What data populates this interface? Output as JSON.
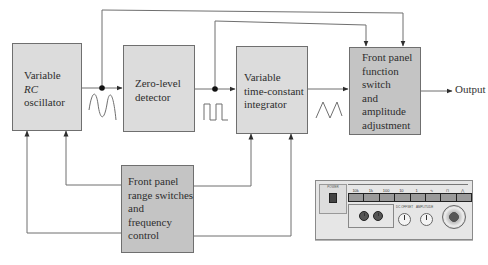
{
  "diagram": {
    "type": "block-diagram",
    "blocks": [
      {
        "id": "osc",
        "lines": [
          "Variable",
          "RC",
          "oscillator"
        ],
        "italic_line": 1
      },
      {
        "id": "zld",
        "lines": [
          "Zero-level",
          "detector"
        ]
      },
      {
        "id": "int",
        "lines": [
          "Variable",
          "time-constant",
          "integrator"
        ]
      },
      {
        "id": "fsw",
        "lines": [
          "Front panel",
          "function",
          "switch",
          "and",
          "amplitude",
          "adjustment"
        ]
      },
      {
        "id": "rng",
        "lines": [
          "Front panel",
          "range switches",
          "and",
          "frequency",
          "control"
        ]
      }
    ],
    "output_label": "Output",
    "waveforms": [
      {
        "between": "osc->zld",
        "shape": "sine"
      },
      {
        "between": "zld->int",
        "shape": "square"
      },
      {
        "between": "int->fsw",
        "shape": "triangle"
      }
    ],
    "connections": [
      {
        "from": "osc",
        "to": "zld"
      },
      {
        "from": "zld",
        "to": "int"
      },
      {
        "from": "int",
        "to": "fsw"
      },
      {
        "from": "fsw",
        "to": "output"
      },
      {
        "from": "osc-output-node",
        "to": "fsw",
        "route": "top"
      },
      {
        "from": "zld-output-node",
        "to": "fsw",
        "route": "top"
      },
      {
        "from": "rng",
        "to": "osc",
        "count": 2
      },
      {
        "from": "rng",
        "to": "int",
        "count": 2
      }
    ],
    "colors": {
      "light_block": "#dcdcdc",
      "dark_block": "#c4c4c4",
      "line": "#6f6f6f",
      "text": "#2e2e2e"
    }
  },
  "panel_photo": {
    "description": "Function generator front panel",
    "range_header": "FREQUENCY RANGE (Hz)",
    "function_header": "FUNCTION",
    "power_label": "POWER",
    "range_buttons": [
      "10k",
      "1k",
      "100",
      "10",
      "1"
    ],
    "function_buttons": [
      "sine",
      "square",
      "triangle"
    ],
    "output_label": "OUTPUT",
    "dc_offset_label": "DC OFFSET",
    "amplitude_label": "AMPLITUDE"
  }
}
